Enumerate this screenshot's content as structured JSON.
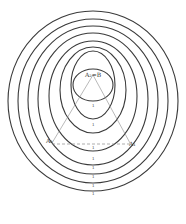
{
  "diagram": {
    "labels": {
      "top": "A₂=B",
      "left": "A₂",
      "right": "A₁"
    },
    "ticks": [
      "1",
      "1",
      "1",
      "1",
      "1",
      "1",
      "1",
      "1"
    ],
    "colors": {
      "stroke": "#3a3a3a",
      "guide": "#8a8a8a",
      "background": "#ffffff"
    }
  }
}
